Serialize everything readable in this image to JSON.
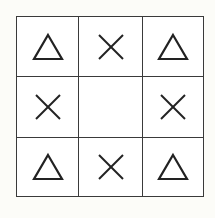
{
  "figure": {
    "type": "3x3 symbol grid",
    "stroke_color": "#222222",
    "cells": [
      {
        "row": 1,
        "col": 1,
        "symbol": "triangle"
      },
      {
        "row": 1,
        "col": 2,
        "symbol": "cross"
      },
      {
        "row": 1,
        "col": 3,
        "symbol": "triangle"
      },
      {
        "row": 2,
        "col": 1,
        "symbol": "cross"
      },
      {
        "row": 2,
        "col": 2,
        "symbol": "empty"
      },
      {
        "row": 2,
        "col": 3,
        "symbol": "cross"
      },
      {
        "row": 3,
        "col": 1,
        "symbol": "triangle"
      },
      {
        "row": 3,
        "col": 2,
        "symbol": "cross"
      },
      {
        "row": 3,
        "col": 3,
        "symbol": "triangle"
      }
    ]
  }
}
